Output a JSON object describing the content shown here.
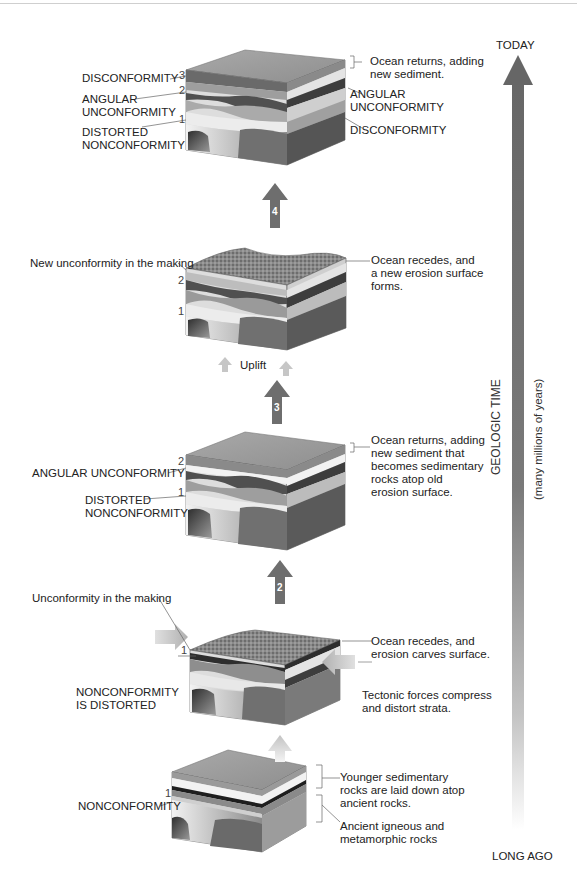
{
  "timeline": {
    "top_label": "TODAY",
    "bottom_label": "LONG AGO",
    "axis_label": "GEOLOGIC TIME",
    "axis_sublabel": "(many millions of years)"
  },
  "stages": [
    {
      "id": "stage-1-bottom",
      "left_labels": [
        "NONCONFORMITY"
      ],
      "layer_numbers": [
        "1"
      ],
      "right_labels": [
        "Younger sedimentary\nrocks are laid down atop\nancient rocks.",
        "Ancient igneous and\nmetamorphic rocks"
      ]
    },
    {
      "id": "stage-2",
      "arrow_number": "2",
      "left_labels": [
        "Unconformity in the making",
        "NONCONFORMITY\nIS DISTORTED"
      ],
      "layer_numbers": [
        "1"
      ],
      "right_labels": [
        "Ocean recedes, and\nerosion carves surface.",
        "Tectonic forces compress\nand distort strata."
      ]
    },
    {
      "id": "stage-3",
      "arrow_number": "3",
      "left_labels": [
        "ANGULAR UNCONFORMITY",
        "DISTORTED\nNONCONFORMITY"
      ],
      "layer_numbers": [
        "2",
        "1"
      ],
      "right_labels": [
        "Ocean returns, adding\nnew sediment that\nbecomes sedimentary\nrocks atop old\nerosion surface."
      ]
    },
    {
      "id": "stage-4",
      "arrow_number": "4",
      "left_labels": [
        "New unconformity in the making"
      ],
      "layer_numbers": [
        "2",
        "1"
      ],
      "right_labels": [
        "Ocean recedes, and\na new erosion surface\nforms."
      ],
      "uplift_label": "Uplift"
    },
    {
      "id": "stage-5-top",
      "left_labels": [
        "DISCONFORMITY",
        "ANGULAR\nUNCONFORMITY",
        "DISTORTED\nNONCONFORMITY"
      ],
      "layer_numbers": [
        "3",
        "2",
        "1"
      ],
      "right_labels": [
        "Ocean returns, adding\nnew sediment.",
        "ANGULAR\nUNCONFORMITY",
        "DISCONFORMITY"
      ]
    }
  ],
  "colors": {
    "arrow_dark": "#6e6e6e",
    "arrow_light": "#c8c8c8",
    "timeline_top": "#6a6a6a",
    "timeline_bottom": "#ffffff",
    "surface": "#9a9a9a",
    "land_surface": "#7a7a7a",
    "layer_light": "#e6e6e6",
    "layer_mid": "#a8a8a8",
    "layer_dark": "#505050",
    "basement_dark": "#3a3a3a"
  }
}
